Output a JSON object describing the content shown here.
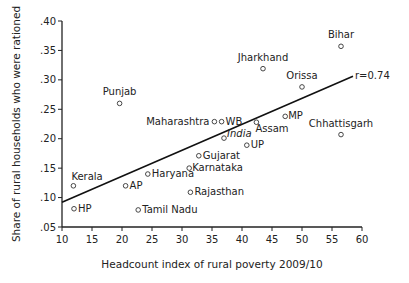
{
  "chart_data": {
    "type": "scatter",
    "title": "",
    "xlabel": "Headcount index of rural poverty 2009/10",
    "ylabel": "Share of rural households who were rationed",
    "xlim": [
      10,
      60
    ],
    "ylim": [
      0.05,
      0.4
    ],
    "xticks": [
      10,
      15,
      20,
      25,
      30,
      35,
      40,
      45,
      50,
      55,
      60
    ],
    "yticks": [
      ".05",
      ".10",
      ".15",
      ".20",
      ".25",
      ".30",
      ".35",
      ".40"
    ],
    "grid": false,
    "points": [
      {
        "label": "Bihar",
        "x": 56.5,
        "y": 0.357,
        "lx": 0,
        "ly": -8,
        "anchor": "middle"
      },
      {
        "label": "Jharkhand",
        "x": 43.5,
        "y": 0.319,
        "lx": 0,
        "ly": -8,
        "anchor": "middle"
      },
      {
        "label": "Orissa",
        "x": 50.0,
        "y": 0.288,
        "lx": 0,
        "ly": -8,
        "anchor": "middle"
      },
      {
        "label": "Punjab",
        "x": 19.6,
        "y": 0.26,
        "lx": 0,
        "ly": -8,
        "anchor": "middle"
      },
      {
        "label": "Maharashtra",
        "x": 35.4,
        "y": 0.229,
        "lx": -5,
        "ly": 3,
        "anchor": "end"
      },
      {
        "label": "WB",
        "x": 36.6,
        "y": 0.229,
        "lx": 4,
        "ly": 3,
        "anchor": "start"
      },
      {
        "label": "MP",
        "x": 47.2,
        "y": 0.238,
        "lx": 3,
        "ly": 3,
        "anchor": "start"
      },
      {
        "label": "Assam",
        "x": 42.4,
        "y": 0.228,
        "lx": -1,
        "ly": 10,
        "anchor": "start"
      },
      {
        "label": "India",
        "x": 37.0,
        "y": 0.201,
        "lx": 3,
        "ly": -1,
        "anchor": "start",
        "italic": true
      },
      {
        "label": "UP",
        "x": 40.8,
        "y": 0.189,
        "lx": 4,
        "ly": 3,
        "anchor": "start"
      },
      {
        "label": "Chhattisgarh",
        "x": 56.5,
        "y": 0.207,
        "lx": 0,
        "ly": -8,
        "anchor": "middle"
      },
      {
        "label": "Gujarat",
        "x": 32.8,
        "y": 0.171,
        "lx": 4,
        "ly": 3,
        "anchor": "start"
      },
      {
        "label": "Karnataka",
        "x": 31.2,
        "y": 0.15,
        "lx": 3,
        "ly": 3,
        "anchor": "start"
      },
      {
        "label": "Haryana",
        "x": 24.3,
        "y": 0.14,
        "lx": 4,
        "ly": 3,
        "anchor": "start"
      },
      {
        "label": "AP",
        "x": 20.6,
        "y": 0.12,
        "lx": 4,
        "ly": 3,
        "anchor": "start"
      },
      {
        "label": "Kerala",
        "x": 11.9,
        "y": 0.12,
        "lx": -2,
        "ly": -6,
        "anchor": "start"
      },
      {
        "label": "Rajasthan",
        "x": 31.4,
        "y": 0.109,
        "lx": 4,
        "ly": 3,
        "anchor": "start"
      },
      {
        "label": "HP",
        "x": 12.0,
        "y": 0.081,
        "lx": 4,
        "ly": 3,
        "anchor": "start"
      },
      {
        "label": "Tamil Nadu",
        "x": 22.7,
        "y": 0.079,
        "lx": 4,
        "ly": 3,
        "anchor": "start"
      }
    ],
    "fit_line": {
      "x1": 10,
      "y1": 0.092,
      "x2": 58.5,
      "y2": 0.306,
      "label": "r=0.74"
    }
  }
}
